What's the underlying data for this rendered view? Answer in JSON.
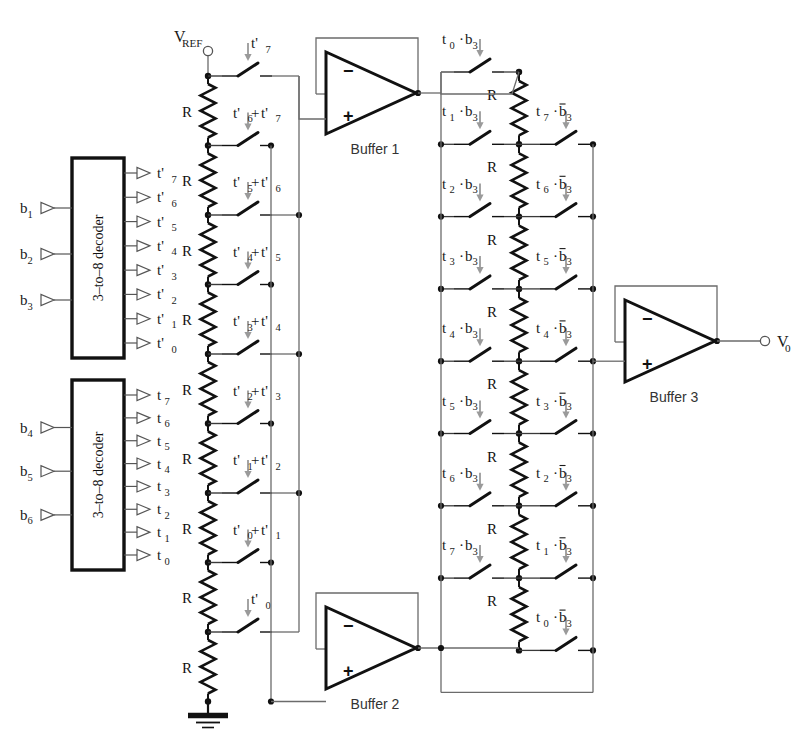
{
  "decoders": [
    {
      "name": "3-to-8 decoder",
      "label": "3–to–8 decoder",
      "inputs": [
        "b",
        "b",
        "b"
      ],
      "input_labels": [
        "b1",
        "b2",
        "b3"
      ],
      "input_base": [
        "b",
        "b",
        "b"
      ],
      "input_sub": [
        "1",
        "2",
        "3"
      ],
      "outputs_base": [
        "t'",
        "t'",
        "t'",
        "t'",
        "t'",
        "t'",
        "t'",
        "t'"
      ],
      "outputs_sub": [
        "7",
        "6",
        "5",
        "4",
        "3",
        "2",
        "1",
        "0"
      ]
    },
    {
      "name": "3-to-8 decoder",
      "label": "3–to–8 decoder",
      "input_base": [
        "b",
        "b",
        "b"
      ],
      "input_sub": [
        "4",
        "5",
        "6"
      ],
      "outputs_base": [
        "t",
        "t",
        "t",
        "t",
        "t",
        "t",
        "t",
        "t"
      ],
      "outputs_sub": [
        "7",
        "6",
        "5",
        "4",
        "3",
        "2",
        "1",
        "0"
      ]
    }
  ],
  "supply": {
    "base": "V",
    "sub": "REF"
  },
  "output": {
    "base": "V",
    "sub": "0"
  },
  "resistor_label": "R",
  "left_ladder": {
    "resistor_count": 9,
    "resistor_label": "R",
    "switch_labels": [
      {
        "terms": [
          {
            "base": "t'",
            "sub": "7"
          }
        ]
      },
      {
        "terms": [
          {
            "base": "t'",
            "sub": "6"
          },
          {
            "base": "t'",
            "sub": "7"
          }
        ],
        "op": "+"
      },
      {
        "terms": [
          {
            "base": "t'",
            "sub": "5"
          },
          {
            "base": "t'",
            "sub": "6"
          }
        ],
        "op": "+"
      },
      {
        "terms": [
          {
            "base": "t'",
            "sub": "4"
          },
          {
            "base": "t'",
            "sub": "5"
          }
        ],
        "op": "+"
      },
      {
        "terms": [
          {
            "base": "t'",
            "sub": "3"
          },
          {
            "base": "t'",
            "sub": "4"
          }
        ],
        "op": "+"
      },
      {
        "terms": [
          {
            "base": "t'",
            "sub": "2"
          },
          {
            "base": "t'",
            "sub": "3"
          }
        ],
        "op": "+"
      },
      {
        "terms": [
          {
            "base": "t'",
            "sub": "1"
          },
          {
            "base": "t'",
            "sub": "2"
          }
        ],
        "op": "+"
      },
      {
        "terms": [
          {
            "base": "t'",
            "sub": "0"
          },
          {
            "base": "t'",
            "sub": "1"
          }
        ],
        "op": "+"
      },
      {
        "terms": [
          {
            "base": "t'",
            "sub": "0"
          }
        ]
      }
    ]
  },
  "right_ladder": {
    "resistor_count": 8,
    "resistor_label": "R",
    "left_switch_labels": [
      {
        "a": "t",
        "asub": "0",
        "b": "b",
        "bsub": "3",
        "bar": false
      },
      {
        "a": "t",
        "asub": "1",
        "b": "b",
        "bsub": "3",
        "bar": false
      },
      {
        "a": "t",
        "asub": "2",
        "b": "b",
        "bsub": "3",
        "bar": false
      },
      {
        "a": "t",
        "asub": "3",
        "b": "b",
        "bsub": "3",
        "bar": false
      },
      {
        "a": "t",
        "asub": "4",
        "b": "b",
        "bsub": "3",
        "bar": false
      },
      {
        "a": "t",
        "asub": "5",
        "b": "b",
        "bsub": "3",
        "bar": false
      },
      {
        "a": "t",
        "asub": "6",
        "b": "b",
        "bsub": "3",
        "bar": false
      },
      {
        "a": "t",
        "asub": "7",
        "b": "b",
        "bsub": "3",
        "bar": false
      }
    ],
    "right_switch_labels": [
      {
        "a": "t",
        "asub": "7",
        "b": "b",
        "bsub": "3",
        "bar": true
      },
      {
        "a": "t",
        "asub": "6",
        "b": "b",
        "bsub": "3",
        "bar": true
      },
      {
        "a": "t",
        "asub": "5",
        "b": "b",
        "bsub": "3",
        "bar": true
      },
      {
        "a": "t",
        "asub": "4",
        "b": "b",
        "bsub": "3",
        "bar": true
      },
      {
        "a": "t",
        "asub": "3",
        "b": "b",
        "bsub": "3",
        "bar": true
      },
      {
        "a": "t",
        "asub": "2",
        "b": "b",
        "bsub": "3",
        "bar": true
      },
      {
        "a": "t",
        "asub": "1",
        "b": "b",
        "bsub": "3",
        "bar": true
      },
      {
        "a": "t",
        "asub": "0",
        "b": "b",
        "bsub": "3",
        "bar": true
      }
    ]
  },
  "buffers": [
    {
      "label": "Buffer 1",
      "minus": "−",
      "plus": "+"
    },
    {
      "label": "Buffer 2",
      "minus": "−",
      "plus": "+"
    },
    {
      "label": "Buffer 3",
      "minus": "−",
      "plus": "+"
    }
  ],
  "ground": {
    "name": "ground-symbol"
  },
  "colors": {
    "wire": "#6b6b6b",
    "wire_dark": "#3a3a3a",
    "component": "#111111",
    "text": "#1a1a1a",
    "background": "#ffffff",
    "arrow": "#9a9a9a"
  }
}
